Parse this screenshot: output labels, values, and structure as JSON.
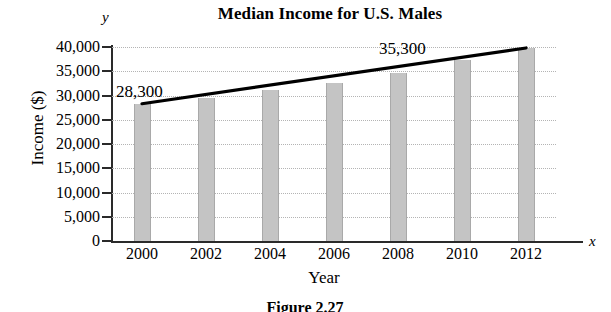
{
  "figure": {
    "caption": "Figure 2.27",
    "y_axis_marker": "y",
    "x_axis_marker": "x"
  },
  "chart_data": {
    "type": "bar",
    "title": "Median Income for U.S. Males",
    "xlabel": "Year",
    "ylabel": "Income ($)",
    "categories": [
      "2000",
      "2002",
      "2004",
      "2006",
      "2008",
      "2010",
      "2012"
    ],
    "values": [
      28300,
      29500,
      31100,
      32600,
      34600,
      37400,
      39800
    ],
    "ylim": [
      0,
      40000
    ],
    "ytick_labels": [
      "0",
      "5,000",
      "10,000",
      "15,000",
      "20,000",
      "25,000",
      "30,000",
      "35,000",
      "40,000"
    ],
    "ytick_values": [
      0,
      5000,
      10000,
      15000,
      20000,
      25000,
      30000,
      35000,
      40000
    ],
    "grid": true,
    "legend": "none",
    "bar_color": "#c4c4c4",
    "line_color": "#000000",
    "annotations": [
      {
        "text": "28,300",
        "year": "2000",
        "value": 28300
      },
      {
        "text": "35,300",
        "year": "2008",
        "value": 35300
      }
    ],
    "trend_line": {
      "label": "median income trend",
      "start": {
        "x": "2000",
        "y": 28300
      },
      "end": {
        "x": "2012",
        "y": 39800
      }
    }
  }
}
